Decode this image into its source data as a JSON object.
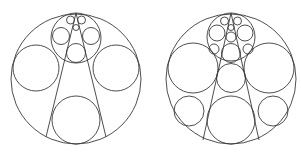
{
  "figure": {
    "stroke_color": "#3a3a3a",
    "background": "#ffffff",
    "panels": [
      {
        "name": "left-packing",
        "outer": {
          "cx": 76,
          "cy": 79,
          "r": 65
        },
        "circles": [
          {
            "cx": 36,
            "cy": 68,
            "r": 23
          },
          {
            "cx": 116,
            "cy": 68,
            "r": 23
          },
          {
            "cx": 76,
            "cy": 120,
            "r": 24
          },
          {
            "cx": 76,
            "cy": 38,
            "r": 25
          },
          {
            "cx": 61,
            "cy": 36,
            "r": 8.5
          },
          {
            "cx": 91,
            "cy": 36,
            "r": 8.5
          },
          {
            "cx": 76,
            "cy": 53,
            "r": 9.5
          },
          {
            "cx": 70.5,
            "cy": 20,
            "r": 4
          },
          {
            "cx": 81.5,
            "cy": 20,
            "r": 4
          },
          {
            "cx": 76,
            "cy": 27.5,
            "r": 3
          }
        ],
        "lines": [
          {
            "x1": 76,
            "y1": 13,
            "x2": 46,
            "y2": 137
          },
          {
            "x1": 76,
            "y1": 13,
            "x2": 106,
            "y2": 137
          }
        ]
      },
      {
        "name": "right-packing",
        "outer": {
          "cx": 231,
          "cy": 79,
          "r": 65
        },
        "circles": [
          {
            "cx": 193,
            "cy": 68,
            "r": 25
          },
          {
            "cx": 269,
            "cy": 68,
            "r": 25
          },
          {
            "cx": 231,
            "cy": 78,
            "r": 14.5
          },
          {
            "cx": 231,
            "cy": 120,
            "r": 24
          },
          {
            "cx": 189,
            "cy": 111,
            "r": 15
          },
          {
            "cx": 273,
            "cy": 111,
            "r": 15
          },
          {
            "cx": 231,
            "cy": 37,
            "r": 24
          },
          {
            "cx": 217,
            "cy": 33,
            "r": 8
          },
          {
            "cx": 245,
            "cy": 33,
            "r": 8
          },
          {
            "cx": 231,
            "cy": 53,
            "r": 9.5
          },
          {
            "cx": 214,
            "cy": 49,
            "r": 5
          },
          {
            "cx": 248,
            "cy": 49,
            "r": 5
          },
          {
            "cx": 231,
            "cy": 37,
            "r": 5
          },
          {
            "cx": 224.5,
            "cy": 21,
            "r": 4
          },
          {
            "cx": 237.5,
            "cy": 21,
            "r": 4
          },
          {
            "cx": 231,
            "cy": 27.5,
            "r": 3
          }
        ],
        "lines": [
          {
            "x1": 231,
            "y1": 13,
            "x2": 203,
            "y2": 140
          },
          {
            "x1": 231,
            "y1": 13,
            "x2": 259,
            "y2": 140
          }
        ]
      }
    ]
  }
}
